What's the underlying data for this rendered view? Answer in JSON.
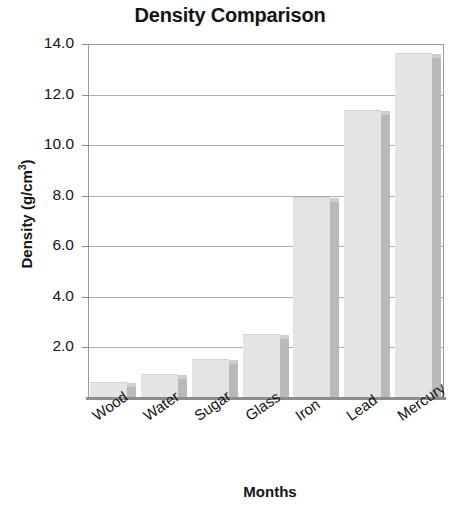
{
  "chart_data": {
    "type": "bar",
    "title": "Density Comparison",
    "xlabel": "Months",
    "ylabel": "Density (g/cm³)",
    "ylabel_main": "Density (g/cm",
    "ylabel_sup": "3",
    "ylabel_tail": ")",
    "categories": [
      "Wood",
      "Water",
      "Sugar",
      "Glass",
      "Iron",
      "Lead",
      "Mercury"
    ],
    "values": [
      0.6,
      0.9,
      1.5,
      2.5,
      7.9,
      11.35,
      13.6
    ],
    "series": [
      {
        "name": "Density",
        "values": [
          0.6,
          0.9,
          1.5,
          2.5,
          7.9,
          11.35,
          13.6
        ]
      }
    ],
    "ylim": [
      0,
      14.0
    ],
    "xlim_categories": 7,
    "ytick_labels": [
      "14.0",
      "12.0",
      "10.0",
      "8.0",
      "6.0",
      "4.0",
      "2.0"
    ],
    "ytick_values": [
      14.0,
      12.0,
      10.0,
      8.0,
      6.0,
      4.0,
      2.0
    ],
    "grid": true,
    "grid_axis": "y",
    "legend": false,
    "legend_position": "none",
    "bar_style": "3d-shaded",
    "colors": {
      "bar_face": "#e4e4e4",
      "bar_side": "#b9b9b9",
      "bar_top": "#cecece",
      "gridline": "#adadad",
      "frame": "#9a9a9a",
      "axis": "#8d8d8d",
      "text": "#141414",
      "background": "#ffffff"
    }
  }
}
